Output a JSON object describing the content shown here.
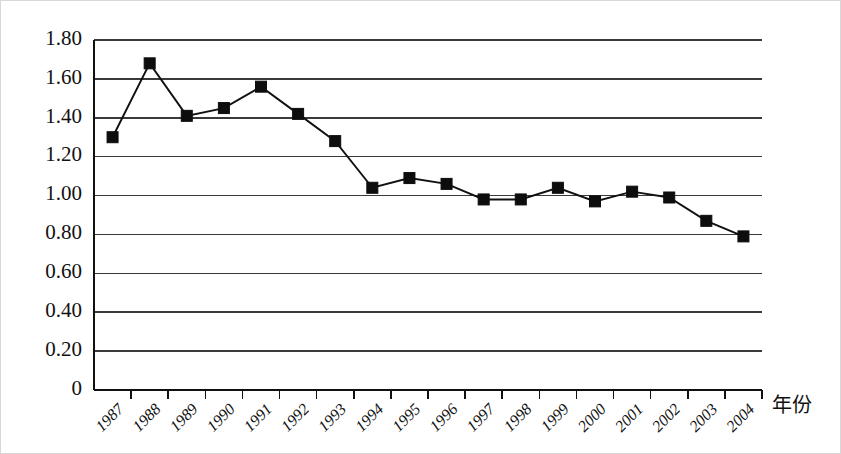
{
  "chart_data": {
    "type": "line",
    "title": "",
    "subtitle": "",
    "xlabel": "年份",
    "ylabel": "",
    "categories": [
      "1987",
      "1988",
      "1989",
      "1990",
      "1991",
      "1992",
      "1993",
      "1994",
      "1995",
      "1996",
      "1997",
      "1998",
      "1999",
      "2000",
      "2001",
      "2002",
      "2003",
      "2004"
    ],
    "values": [
      1.3,
      1.68,
      1.41,
      1.45,
      1.56,
      1.42,
      1.28,
      1.04,
      1.09,
      1.06,
      0.98,
      0.98,
      1.04,
      0.97,
      1.02,
      0.99,
      0.87,
      0.79
    ],
    "series": [
      {
        "name": "",
        "values": [
          1.3,
          1.68,
          1.41,
          1.45,
          1.56,
          1.42,
          1.28,
          1.04,
          1.09,
          1.06,
          0.98,
          0.98,
          1.04,
          0.97,
          1.02,
          0.99,
          0.87,
          0.79
        ]
      }
    ],
    "ylim": [
      0,
      1.8
    ],
    "ytick_labels": [
      "1.80",
      "1.60",
      "1.40",
      "1.20",
      "1.00",
      "0.80",
      "0.60",
      "0.40",
      "0.20",
      "0"
    ],
    "ytick_values": [
      1.8,
      1.6,
      1.4,
      1.2,
      1.0,
      0.8,
      0.6,
      0.4,
      0.2,
      0
    ],
    "grid": true,
    "grid_axis": "y",
    "legend": false,
    "legend_position": "none",
    "marker": "square",
    "line_color": "#111111",
    "marker_color": "#0d0d0d",
    "grid_color": "#3a3a3a",
    "background_color": "#ffffff"
  },
  "axis": {
    "x_title": "年份",
    "x_tick_rotation": "-45"
  }
}
